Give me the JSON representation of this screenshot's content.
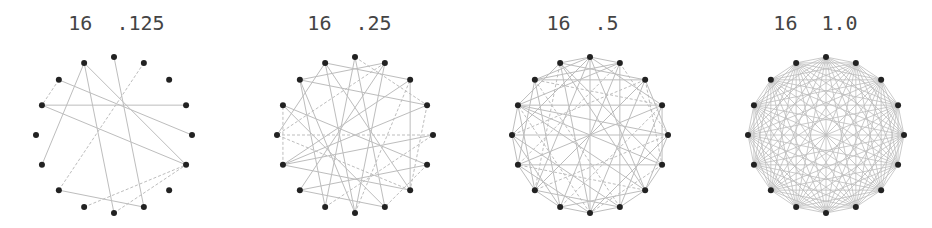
{
  "figure": {
    "style": {
      "node_color": "#222222",
      "edge_color": "#bdbdbd",
      "title_color": "#444444",
      "node_radius": 3,
      "layout_radius": 78
    },
    "graphs": [
      {
        "title": "16  .125",
        "nodes": 16,
        "density": 0.125,
        "center": [
          114,
          135
        ],
        "edges": [
          [
            15,
            11,
            0
          ],
          [
            15,
            8,
            0
          ],
          [
            15,
            5,
            0
          ],
          [
            0,
            7,
            0
          ],
          [
            1,
            10,
            1
          ],
          [
            14,
            13,
            1
          ],
          [
            14,
            4,
            0
          ],
          [
            13,
            3,
            0
          ],
          [
            13,
            5,
            0
          ],
          [
            10,
            7,
            0
          ],
          [
            9,
            5,
            1
          ],
          [
            8,
            5,
            1
          ]
        ]
      },
      {
        "title": "16  .25",
        "nodes": 16,
        "density": 0.25,
        "center": [
          355,
          135
        ],
        "edges": [
          [
            14,
            1,
            0
          ],
          [
            14,
            3,
            0
          ],
          [
            14,
            8,
            0
          ],
          [
            15,
            8,
            0
          ],
          [
            15,
            6,
            0
          ],
          [
            0,
            3,
            1
          ],
          [
            1,
            12,
            1
          ],
          [
            1,
            8,
            0
          ],
          [
            2,
            6,
            0
          ],
          [
            13,
            5,
            0
          ],
          [
            13,
            7,
            0
          ],
          [
            12,
            4,
            1
          ],
          [
            11,
            6,
            0
          ],
          [
            11,
            3,
            0
          ],
          [
            10,
            1,
            0
          ],
          [
            10,
            7,
            0
          ],
          [
            9,
            4,
            1
          ],
          [
            9,
            14,
            0
          ],
          [
            8,
            2,
            1
          ],
          [
            7,
            0,
            0
          ],
          [
            6,
            12,
            1
          ],
          [
            5,
            10,
            0
          ],
          [
            5,
            7,
            1
          ],
          [
            4,
            11,
            0
          ],
          [
            3,
            6,
            1
          ],
          [
            2,
            11,
            0
          ],
          [
            12,
            15,
            0
          ],
          [
            11,
            13,
            1
          ],
          [
            0,
            9,
            0
          ],
          [
            15,
            2,
            0
          ]
        ]
      },
      {
        "title": "16  .5",
        "nodes": 16,
        "density": 0.5,
        "center": [
          590,
          135
        ],
        "edges": [
          [
            0,
            1,
            0
          ],
          [
            0,
            3,
            0
          ],
          [
            0,
            6,
            0
          ],
          [
            0,
            8,
            0
          ],
          [
            0,
            10,
            0
          ],
          [
            0,
            12,
            0
          ],
          [
            0,
            14,
            0
          ],
          [
            0,
            15,
            0
          ],
          [
            1,
            4,
            1
          ],
          [
            1,
            7,
            0
          ],
          [
            1,
            9,
            0
          ],
          [
            1,
            11,
            1
          ],
          [
            1,
            13,
            0
          ],
          [
            1,
            14,
            0
          ],
          [
            2,
            4,
            0
          ],
          [
            2,
            5,
            1
          ],
          [
            2,
            8,
            0
          ],
          [
            2,
            10,
            0
          ],
          [
            2,
            12,
            1
          ],
          [
            2,
            14,
            0
          ],
          [
            2,
            15,
            0
          ],
          [
            3,
            5,
            0
          ],
          [
            3,
            7,
            0
          ],
          [
            3,
            9,
            1
          ],
          [
            3,
            11,
            0
          ],
          [
            3,
            13,
            0
          ],
          [
            3,
            14,
            1
          ],
          [
            4,
            6,
            0
          ],
          [
            4,
            8,
            0
          ],
          [
            4,
            10,
            1
          ],
          [
            4,
            12,
            0
          ],
          [
            4,
            13,
            0
          ],
          [
            5,
            6,
            0
          ],
          [
            5,
            8,
            1
          ],
          [
            5,
            11,
            0
          ],
          [
            5,
            13,
            0
          ],
          [
            5,
            15,
            0
          ],
          [
            6,
            7,
            0
          ],
          [
            6,
            9,
            0
          ],
          [
            6,
            11,
            1
          ],
          [
            6,
            13,
            0
          ],
          [
            6,
            15,
            0
          ],
          [
            7,
            8,
            0
          ],
          [
            7,
            10,
            0
          ],
          [
            7,
            12,
            0
          ],
          [
            7,
            14,
            1
          ],
          [
            8,
            9,
            0
          ],
          [
            8,
            11,
            0
          ],
          [
            8,
            13,
            1
          ],
          [
            8,
            15,
            0
          ],
          [
            9,
            10,
            0
          ],
          [
            9,
            12,
            0
          ],
          [
            9,
            14,
            0
          ],
          [
            10,
            11,
            0
          ],
          [
            10,
            13,
            0
          ],
          [
            10,
            15,
            1
          ],
          [
            11,
            12,
            0
          ],
          [
            11,
            14,
            0
          ],
          [
            12,
            13,
            0
          ],
          [
            13,
            15,
            0
          ]
        ]
      },
      {
        "title": "16  1.0",
        "nodes": 16,
        "density": 1.0,
        "center": [
          826,
          135
        ],
        "complete": true,
        "edges": []
      }
    ]
  }
}
